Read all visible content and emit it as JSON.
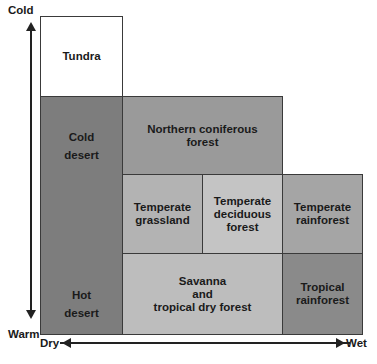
{
  "axes": {
    "y_top": "Cold",
    "y_bottom": "Warm",
    "x_left": "Dry",
    "x_right": "Wet"
  },
  "biomes": {
    "tundra": "Tundra",
    "cold_desert": "Cold\ndesert",
    "hot_desert": "Hot\ndesert",
    "northern_coniferous": "Northern coniferous\nforest",
    "temperate_grassland": "Temperate\ngrassland",
    "temperate_deciduous": "Temperate\ndeciduous\nforest",
    "temperate_rainforest": "Temperate\nrainforest",
    "savanna": "Savanna\nand\ntropical dry forest",
    "tropical_rainforest": "Tropical\nrainforest"
  },
  "colors": {
    "tundra": "#ffffff",
    "desert": "#7d7d7d",
    "coniferous": "#9a9a9a",
    "grassland": "#b3b3b3",
    "deciduous": "#c4c4c4",
    "temperate_rainforest": "#a5a5a5",
    "savanna": "#bdbdbd",
    "tropical_rainforest": "#8a8a8a"
  }
}
